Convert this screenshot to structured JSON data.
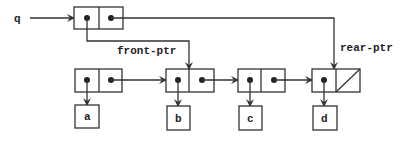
{
  "diagram": {
    "type": "box-and-pointer queue",
    "variable": {
      "label": "q"
    },
    "pointers": {
      "front": {
        "label": "front-ptr"
      },
      "rear": {
        "label": "rear-ptr"
      }
    },
    "list": [
      {
        "car": "a"
      },
      {
        "car": "b"
      },
      {
        "car": "c"
      },
      {
        "car": "d",
        "cdr": "nil"
      }
    ],
    "front_points_to_index": 1,
    "rear_points_to_index": 3,
    "colors": {
      "stroke": "#333333",
      "background": "#ffffff"
    }
  }
}
